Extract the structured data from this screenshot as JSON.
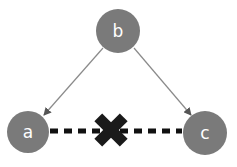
{
  "diagram": {
    "type": "graph",
    "colors": {
      "background": "#ffffff",
      "node_fill": "#7a7a7a",
      "node_text": "#ffffff",
      "arrow": "#8a8a8a",
      "dashed_edge": "#111111",
      "cross": "#1a1a1a"
    },
    "nodes": [
      {
        "id": "a",
        "label": "a",
        "cx": 28,
        "cy": 132,
        "r": 21
      },
      {
        "id": "b",
        "label": "b",
        "cx": 118,
        "cy": 31,
        "r": 22
      },
      {
        "id": "c",
        "label": "c",
        "cx": 205,
        "cy": 133,
        "r": 22
      }
    ],
    "edges": [
      {
        "from": "b",
        "to": "a",
        "style": "solid-arrow"
      },
      {
        "from": "b",
        "to": "c",
        "style": "solid-arrow"
      },
      {
        "from": "a",
        "to": "c",
        "style": "dashed",
        "blocked": true
      }
    ],
    "cross_mark": {
      "icon": "cross-icon",
      "cx": 111,
      "cy": 130,
      "size": 32
    }
  }
}
